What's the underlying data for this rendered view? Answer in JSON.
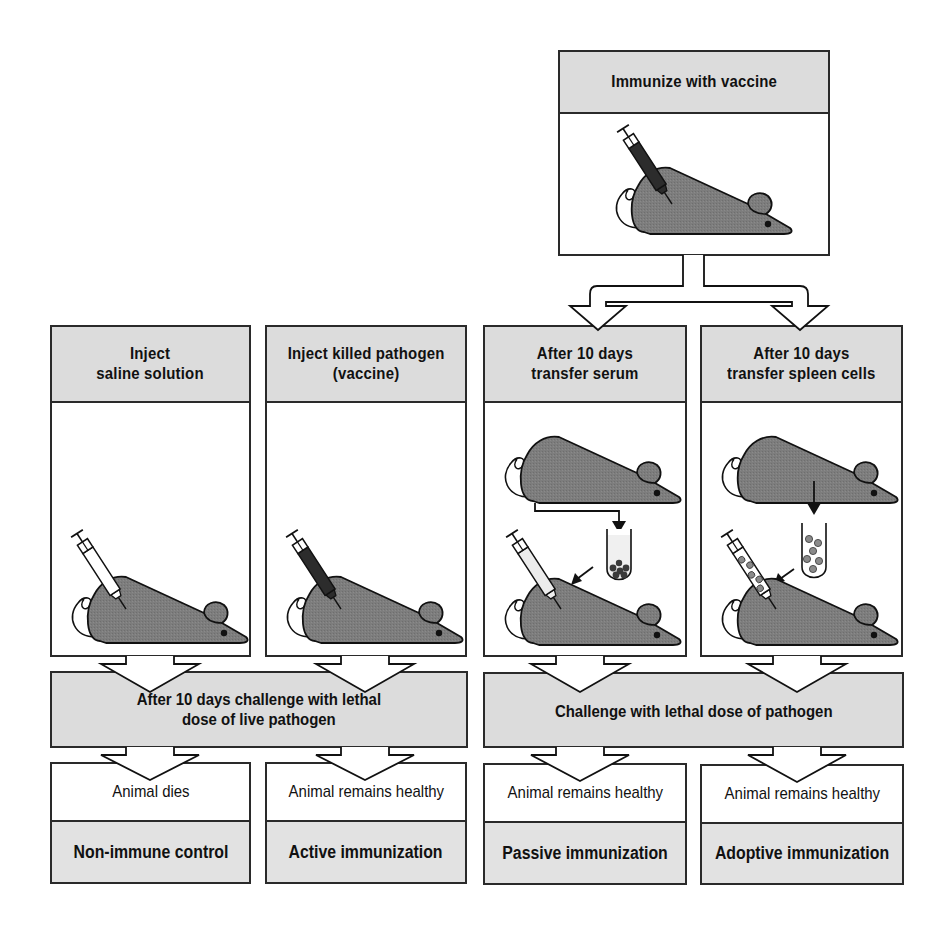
{
  "top": {
    "title": "Immunize with vaccine",
    "illustration": "mouse-injected-with-dark-vaccine-syringe"
  },
  "columns": [
    {
      "id": "saline",
      "title": "Inject\nsaline solution",
      "illustration": "mouse-injected-with-empty-syringe"
    },
    {
      "id": "killed",
      "title": "Inject killed pathogen\n(vaccine)",
      "illustration": "mouse-injected-with-dark-vaccine-syringe"
    },
    {
      "id": "serum",
      "title": "After 10 days\ntransfer serum",
      "illustration": "serum-from-donor-mouse-into-tube-then-injected"
    },
    {
      "id": "spleen",
      "title": "After 10 days\ntransfer spleen cells",
      "illustration": "spleen-cells-from-donor-mouse-into-tube-then-injected"
    }
  ],
  "challenges": {
    "left": "After 10 days challenge with lethal\ndose of live pathogen",
    "right": "Challenge with lethal dose of pathogen"
  },
  "results": [
    {
      "outcome": "Animal dies",
      "label": "Non-immune control"
    },
    {
      "outcome": "Animal remains healthy",
      "label": "Active immunization"
    },
    {
      "outcome": "Animal remains healthy",
      "label": "Passive immunization"
    },
    {
      "outcome": "Animal remains healthy",
      "label": "Adoptive immunization"
    }
  ],
  "colors": {
    "header_fill": "#dcdcdc",
    "mouse_fill": "#7a7a7a",
    "border": "#2a2a2a",
    "vaccine_dark": "#2c2c2c"
  }
}
